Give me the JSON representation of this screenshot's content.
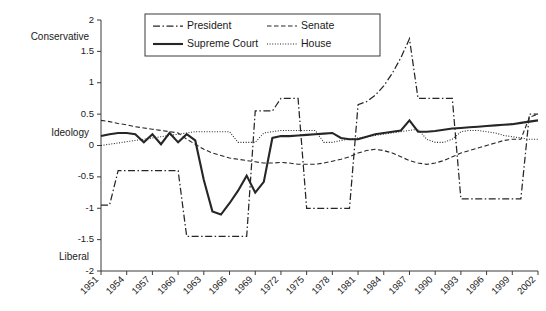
{
  "chart_data": {
    "type": "line",
    "title": "",
    "xlabel": "",
    "ylabel": "Ideology",
    "ylim": [
      -2,
      2
    ],
    "xlim": [
      1951,
      2002
    ],
    "grid": false,
    "legend_position": "top-center",
    "y_axis_top_label": "Conservative",
    "y_axis_mid_label": "Ideology",
    "y_axis_bottom_label": "Liberal",
    "ytick_labels": [
      "2",
      "1.5",
      "1",
      "0.5",
      "0",
      "-0.5",
      "-1",
      "-1.5",
      "-2"
    ],
    "ytick_values": [
      2,
      1.5,
      1,
      0.5,
      0,
      -0.5,
      -1,
      -1.5,
      -2
    ],
    "xtick_labels": [
      "1951",
      "1954",
      "1957",
      "1960",
      "1963",
      "1966",
      "1969",
      "1972",
      "1975",
      "1978",
      "1981",
      "1984",
      "1987",
      "1990",
      "1993",
      "1996",
      "1999",
      "2002"
    ],
    "xtick_values": [
      1951,
      1954,
      1957,
      1960,
      1963,
      1966,
      1969,
      1972,
      1975,
      1978,
      1981,
      1984,
      1987,
      1990,
      1993,
      1996,
      1999,
      2002
    ],
    "x": [
      1951,
      1952,
      1953,
      1954,
      1955,
      1956,
      1957,
      1958,
      1959,
      1960,
      1961,
      1962,
      1963,
      1964,
      1965,
      1966,
      1967,
      1968,
      1969,
      1970,
      1971,
      1972,
      1973,
      1974,
      1975,
      1976,
      1977,
      1978,
      1979,
      1980,
      1981,
      1982,
      1983,
      1984,
      1985,
      1986,
      1987,
      1988,
      1989,
      1990,
      1991,
      1992,
      1993,
      1994,
      1995,
      1996,
      1997,
      1998,
      1999,
      2000,
      2001,
      2002
    ],
    "series": [
      {
        "name": "President",
        "style": "dash-dot",
        "color": "#262626",
        "values": [
          -0.95,
          -0.95,
          -0.4,
          -0.4,
          -0.4,
          -0.4,
          -0.4,
          -0.4,
          -0.4,
          -0.4,
          -1.45,
          -1.45,
          -1.45,
          -1.45,
          -1.45,
          -1.45,
          -1.45,
          -1.45,
          0.55,
          0.55,
          0.55,
          0.75,
          0.75,
          0.75,
          -1.0,
          -1.0,
          -1.0,
          -1.0,
          -1.0,
          -1.0,
          0.65,
          0.7,
          0.8,
          0.95,
          1.15,
          1.4,
          1.7,
          0.75,
          0.75,
          0.75,
          0.75,
          0.75,
          -0.85,
          -0.85,
          -0.85,
          -0.85,
          -0.85,
          -0.85,
          -0.85,
          -0.85,
          0.5,
          0.5
        ]
      },
      {
        "name": "Supreme Court",
        "style": "solid",
        "color": "#262626",
        "values": [
          0.15,
          0.18,
          0.2,
          0.2,
          0.18,
          0.05,
          0.18,
          0.02,
          0.2,
          0.05,
          0.18,
          0.08,
          -0.55,
          -1.05,
          -1.1,
          -0.92,
          -0.72,
          -0.48,
          -0.75,
          -0.58,
          0.12,
          0.15,
          0.15,
          0.16,
          0.17,
          0.18,
          0.19,
          0.2,
          0.12,
          0.1,
          0.1,
          0.14,
          0.18,
          0.2,
          0.22,
          0.24,
          0.4,
          0.22,
          0.22,
          0.23,
          0.25,
          0.27,
          0.28,
          0.29,
          0.3,
          0.31,
          0.32,
          0.33,
          0.34,
          0.36,
          0.38,
          0.4
        ]
      },
      {
        "name": "Senate",
        "style": "dashed",
        "color": "#262626",
        "values": [
          0.4,
          0.38,
          0.35,
          0.33,
          0.3,
          0.28,
          0.26,
          0.24,
          0.22,
          0.2,
          0.1,
          0.02,
          -0.06,
          -0.12,
          -0.16,
          -0.2,
          -0.22,
          -0.24,
          -0.26,
          -0.28,
          -0.28,
          -0.27,
          -0.28,
          -0.3,
          -0.3,
          -0.3,
          -0.28,
          -0.25,
          -0.22,
          -0.18,
          -0.12,
          -0.08,
          -0.06,
          -0.08,
          -0.12,
          -0.18,
          -0.24,
          -0.28,
          -0.3,
          -0.28,
          -0.24,
          -0.18,
          -0.12,
          -0.08,
          -0.04,
          0.0,
          0.04,
          0.08,
          0.1,
          0.1,
          0.45,
          0.5
        ]
      },
      {
        "name": "House",
        "style": "dotted",
        "color": "#262626",
        "values": [
          0.0,
          0.02,
          0.04,
          0.06,
          0.08,
          0.1,
          0.12,
          0.14,
          0.16,
          0.18,
          0.2,
          0.22,
          0.22,
          0.22,
          0.22,
          0.22,
          0.05,
          0.05,
          0.05,
          0.2,
          0.22,
          0.24,
          0.24,
          0.24,
          0.24,
          0.24,
          0.05,
          0.05,
          0.08,
          0.1,
          0.12,
          0.14,
          0.16,
          0.18,
          0.2,
          0.22,
          0.24,
          0.26,
          0.1,
          0.05,
          0.05,
          0.1,
          0.22,
          0.24,
          0.24,
          0.22,
          0.2,
          0.16,
          0.14,
          0.12,
          0.1,
          0.1
        ]
      }
    ]
  },
  "legend": {
    "items": [
      {
        "label": "President",
        "style": "dash-dot"
      },
      {
        "label": "Senate",
        "style": "dashed"
      },
      {
        "label": "Supreme Court",
        "style": "solid"
      },
      {
        "label": "House",
        "style": "dotted"
      }
    ]
  }
}
